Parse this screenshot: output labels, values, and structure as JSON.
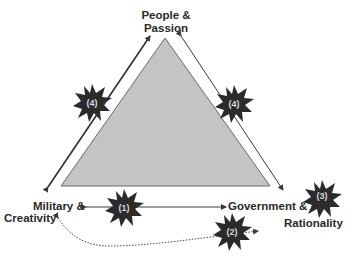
{
  "diagram": {
    "type": "trinity-triangle",
    "vertices": {
      "top": {
        "line1": "People &",
        "line2": "Passion"
      },
      "left": {
        "line1": "Military &",
        "line2": "Creativity"
      },
      "right": {
        "line1": "Government &",
        "line2": "Rationality"
      }
    },
    "markers": [
      {
        "id": "marker-4-left",
        "label": "(4)",
        "position": "left edge"
      },
      {
        "id": "marker-4-right",
        "label": "(4)",
        "position": "right edge"
      },
      {
        "id": "marker-1",
        "label": "(1)",
        "position": "bottom horizontal arrow"
      },
      {
        "id": "marker-2",
        "label": "(2)",
        "position": "dotted curved arrow"
      },
      {
        "id": "marker-3",
        "label": "(3)",
        "position": "right vertex"
      }
    ],
    "colors": {
      "triangle_fill": "#c4c4c4",
      "triangle_stroke": "#6a6a6a",
      "arrow": "#3a3a3a",
      "burst_fill": "#2b2b2b",
      "burst_text": "#d8d8d8",
      "label_text": "#2a2a2a"
    }
  }
}
